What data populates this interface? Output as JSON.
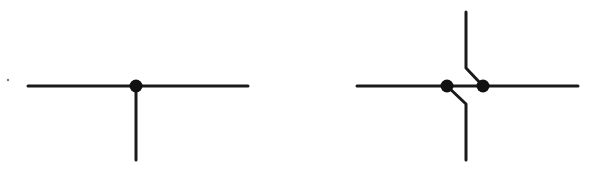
{
  "diagram": {
    "stroke_color": "#1a1a1a",
    "dot_color": "#111111",
    "background": "#ffffff",
    "stroke_width": 3,
    "dot_radius": 6.5,
    "symbols": [
      {
        "name": "t-junction",
        "lines": [
          {
            "x1": 28,
            "y1": 86,
            "x2": 248,
            "y2": 86
          },
          {
            "x1": 136,
            "y1": 86,
            "x2": 136,
            "y2": 160
          }
        ],
        "dots": [
          {
            "cx": 136,
            "cy": 86
          }
        ]
      },
      {
        "name": "staggered-double-junction",
        "lines": [
          {
            "x1": 357,
            "y1": 86,
            "x2": 578,
            "y2": 86
          }
        ],
        "polylines": [
          {
            "points": "466,12 466,68 483,86"
          },
          {
            "points": "447,86 466,104 466,160"
          }
        ],
        "dots": [
          {
            "cx": 447,
            "cy": 86
          },
          {
            "cx": 483,
            "cy": 86
          }
        ]
      }
    ],
    "speck": {
      "cx": 8,
      "cy": 80
    }
  }
}
